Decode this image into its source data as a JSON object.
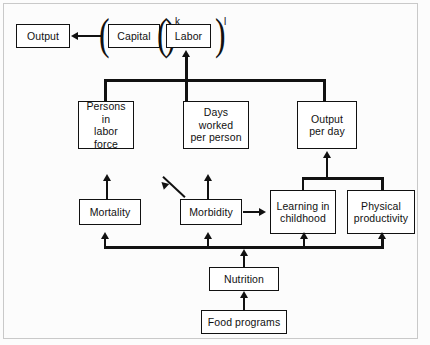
{
  "figure": {
    "line_color": "#111111",
    "box_fill": "#ffffff",
    "background": "#ffffff"
  },
  "nodes": {
    "output": {
      "label": "Output"
    },
    "capital": {
      "label": "Capital",
      "exponent": "k"
    },
    "labor": {
      "label": "Labor",
      "exponent": "l"
    },
    "persons_in_labor_force": {
      "line1": "Persons in",
      "line2": "labor",
      "line3": "force"
    },
    "days_worked": {
      "line1": "Days worked",
      "line2": "per person"
    },
    "output_per_day": {
      "line1": "Output",
      "line2": "per day"
    },
    "mortality": {
      "label": "Mortality"
    },
    "morbidity": {
      "label": "Morbidity"
    },
    "learning_in_childhood": {
      "line1": "Learning in",
      "line2": "childhood"
    },
    "physical_productivity": {
      "line1": "Physical",
      "line2": "productivity"
    },
    "nutrition": {
      "label": "Nutrition"
    },
    "food_programs": {
      "label": "Food programs"
    }
  },
  "edges": [
    {
      "from": "capital",
      "to": "output",
      "direction": "left"
    },
    {
      "from": "labor_inputs_bus",
      "to": "labor",
      "direction": "up"
    },
    {
      "from": "persons_in_labor_force",
      "to": "labor_inputs_bus",
      "direction": "up"
    },
    {
      "from": "days_worked",
      "to": "labor_inputs_bus",
      "direction": "up"
    },
    {
      "from": "output_per_day",
      "to": "labor_inputs_bus",
      "direction": "up"
    },
    {
      "from": "mortality",
      "to": "persons_in_labor_force",
      "direction": "up"
    },
    {
      "from": "morbidity",
      "to": "days_worked",
      "direction": "up"
    },
    {
      "from": "morbidity",
      "to": "upper_left",
      "direction": "diagonal"
    },
    {
      "from": "morbidity",
      "to": "learning_in_childhood",
      "direction": "right"
    },
    {
      "from": "learning_in_childhood",
      "to": "output_per_day",
      "direction": "up"
    },
    {
      "from": "physical_productivity",
      "to": "output_per_day",
      "direction": "up"
    },
    {
      "from": "nutrition_bus",
      "to": "mortality",
      "direction": "up"
    },
    {
      "from": "nutrition_bus",
      "to": "morbidity",
      "direction": "up"
    },
    {
      "from": "nutrition_bus",
      "to": "learning_in_childhood",
      "direction": "up"
    },
    {
      "from": "nutrition_bus",
      "to": "physical_productivity",
      "direction": "up"
    },
    {
      "from": "nutrition",
      "to": "nutrition_bus",
      "direction": "up"
    },
    {
      "from": "food_programs",
      "to": "nutrition",
      "direction": "up"
    }
  ]
}
